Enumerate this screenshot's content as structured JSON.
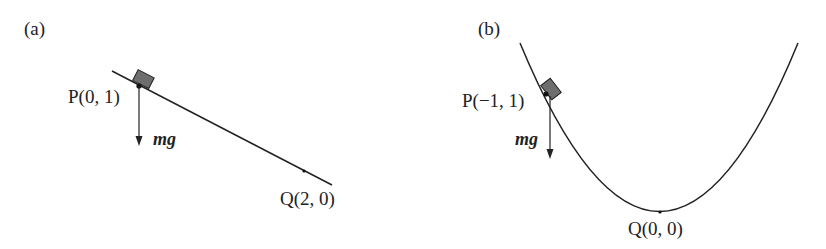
{
  "panels": [
    {
      "id": "a",
      "label": "(a)",
      "curve": "straight incline line",
      "point_P": "P(0, 1)",
      "point_Q": "Q(2, 0)",
      "force_label": "mg"
    },
    {
      "id": "b",
      "label": "(b)",
      "curve": "parabola",
      "point_P": "P(−1, 1)",
      "point_Q": "Q(0, 0)",
      "force_label": "mg"
    }
  ],
  "colors": {
    "line": "#222222",
    "block_fill": "#6e6e6e",
    "text": "#222222"
  }
}
